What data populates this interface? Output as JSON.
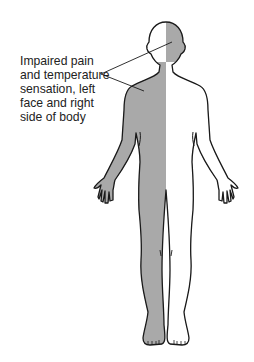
{
  "figure": {
    "type": "body-sensory-map",
    "annotation": {
      "lines": [
        "Impaired pain",
        "and temperature",
        "sensation, left",
        "face and right",
        "side of body"
      ]
    },
    "colors": {
      "affected": "#a9a9a9",
      "unaffected": "#ffffff",
      "outline": "#1a1a1a"
    },
    "affected_regions": [
      "left-face",
      "right-body"
    ]
  }
}
